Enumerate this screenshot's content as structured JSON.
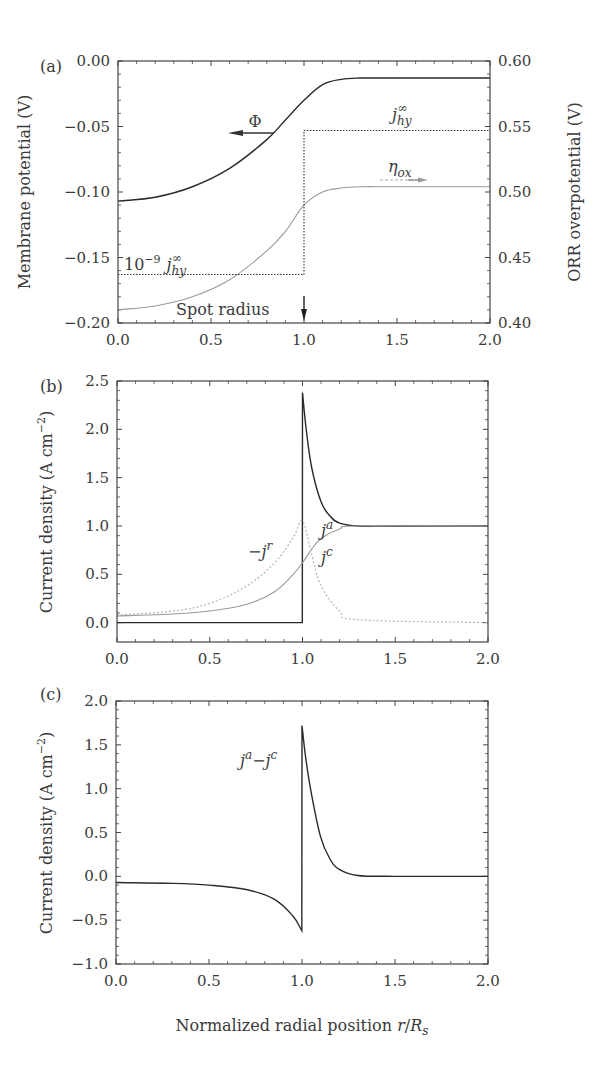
{
  "figure": {
    "xlabel": "Normalized radial position r/R_s",
    "xlabel_parts": {
      "main": "Normalized radial position ",
      "var": "r",
      "slash": "/",
      "R": "R",
      "sub": "s"
    }
  },
  "chart_data": [
    {
      "panel": "(a)",
      "type": "line",
      "xlabel": "",
      "ylabel": "Membrane potential (V)",
      "ylabel_right": "ORR overpotential (V)",
      "xlim": [
        0.0,
        2.0
      ],
      "ylim": [
        -0.2,
        0.0
      ],
      "ylim_right": [
        0.4,
        0.6
      ],
      "x_ticks": [
        "0.0",
        "0.5",
        "1.0",
        "1.5",
        "2.0"
      ],
      "y_ticks": [
        "0.00",
        "−0.05",
        "−0.10",
        "−0.15",
        "−0.20"
      ],
      "y_ticks_right": [
        "0.60",
        "0.55",
        "0.50",
        "0.45",
        "0.40"
      ],
      "grid": false,
      "series": [
        {
          "name": "Φ",
          "axis": "left",
          "style": "solid-dark",
          "x": [
            0.0,
            0.2,
            0.4,
            0.6,
            0.8,
            0.9,
            1.0,
            1.1,
            1.2,
            1.3,
            1.5,
            2.0
          ],
          "y": [
            -0.107,
            -0.104,
            -0.096,
            -0.082,
            -0.06,
            -0.045,
            -0.03,
            -0.018,
            -0.014,
            -0.013,
            -0.013,
            -0.013
          ]
        },
        {
          "name": "η_ox",
          "axis": "right",
          "style": "solid-light",
          "x": [
            0.0,
            0.2,
            0.4,
            0.6,
            0.8,
            0.9,
            1.0,
            1.1,
            1.2,
            1.3,
            1.5,
            2.0
          ],
          "y": [
            0.41,
            0.413,
            0.42,
            0.433,
            0.455,
            0.47,
            0.49,
            0.5,
            0.503,
            0.504,
            0.504,
            0.504
          ]
        },
        {
          "name": "j_hy",
          "axis": "left",
          "style": "dotted",
          "x": [
            0.0,
            1.0,
            1.0,
            2.0
          ],
          "y": [
            -0.163,
            -0.163,
            -0.053,
            -0.053
          ]
        }
      ],
      "annotations": [
        {
          "text": "Φ",
          "arrow": "left"
        },
        {
          "text": "η_ox",
          "arrow": "right"
        },
        {
          "text": "j_hy^∞"
        },
        {
          "text": "10^−9 j_hy^∞"
        },
        {
          "text": "Spot radius",
          "arrow": "down",
          "x": 1.0
        }
      ]
    },
    {
      "panel": "(b)",
      "type": "line",
      "xlabel": "",
      "ylabel": "Current density (A cm^−2)",
      "xlim": [
        0.0,
        2.0
      ],
      "ylim": [
        -0.2,
        2.5
      ],
      "x_ticks": [
        "0.0",
        "0.5",
        "1.0",
        "1.5",
        "2.0"
      ],
      "y_ticks": [
        "2.5",
        "2.0",
        "1.5",
        "1.0",
        "0.5",
        "0.0"
      ],
      "grid": false,
      "series": [
        {
          "name": "j^a",
          "style": "solid-dark",
          "x": [
            0.0,
            0.999,
            1.0,
            1.02,
            1.05,
            1.1,
            1.15,
            1.2,
            1.3,
            1.5,
            2.0
          ],
          "y": [
            0.0,
            0.0,
            2.38,
            2.0,
            1.6,
            1.25,
            1.1,
            1.03,
            1.0,
            1.0,
            1.0
          ]
        },
        {
          "name": "j^c",
          "style": "solid-light",
          "x": [
            0.0,
            0.3,
            0.5,
            0.7,
            0.85,
            0.95,
            1.0,
            1.05,
            1.1,
            1.2,
            1.3,
            2.0
          ],
          "y": [
            0.07,
            0.09,
            0.12,
            0.19,
            0.32,
            0.5,
            0.62,
            0.76,
            0.87,
            0.97,
            1.0,
            1.0
          ]
        },
        {
          "name": "−j^r",
          "style": "dotted-light",
          "x": [
            0.0,
            0.3,
            0.5,
            0.7,
            0.85,
            0.95,
            1.0,
            1.05,
            1.1,
            1.2,
            1.3,
            2.0
          ],
          "y": [
            0.08,
            0.12,
            0.2,
            0.38,
            0.62,
            0.88,
            1.05,
            0.7,
            0.38,
            0.12,
            0.03,
            0.0
          ]
        }
      ],
      "annotations": [
        {
          "text": "j^a"
        },
        {
          "text": "j^c"
        },
        {
          "text": "−j^r"
        }
      ]
    },
    {
      "panel": "(c)",
      "type": "line",
      "xlabel": "Normalized radial position r/R_s",
      "ylabel": "Current density (A cm^−2)",
      "xlim": [
        0.0,
        2.0
      ],
      "ylim": [
        -1.0,
        2.0
      ],
      "x_ticks": [
        "0.0",
        "0.5",
        "1.0",
        "1.5",
        "2.0"
      ],
      "y_ticks": [
        "2.0",
        "1.5",
        "1.0",
        "0.5",
        "0.0",
        "−0.5",
        "−1.0"
      ],
      "grid": false,
      "series": [
        {
          "name": "j^a − j^c",
          "style": "solid-dark",
          "x": [
            0.0,
            0.3,
            0.5,
            0.7,
            0.85,
            0.95,
            0.999,
            1.0,
            1.02,
            1.05,
            1.1,
            1.15,
            1.2,
            1.3,
            1.5,
            2.0
          ],
          "y": [
            -0.07,
            -0.08,
            -0.1,
            -0.15,
            -0.26,
            -0.45,
            -0.62,
            1.72,
            1.35,
            0.95,
            0.45,
            0.2,
            0.08,
            0.01,
            0.0,
            0.0
          ]
        }
      ],
      "annotations": [
        {
          "text": "j^a−j^c"
        }
      ]
    }
  ],
  "labels": {
    "a": {
      "panel": "(a)",
      "ylabel": "Membrane potential (V)",
      "ylabel_right": "ORR overpotential (V)",
      "phi": "Φ",
      "eta": "η",
      "eta_sub": "ox",
      "j": "j",
      "j_sub": "hy",
      "j_sup": "∞",
      "ten": "10",
      "ten_sup": "−9",
      "spot": "Spot radius"
    },
    "b": {
      "panel": "(b)",
      "ylabel_main": "Current density (A  cm",
      "ylabel_sup": "−2",
      "ylabel_end": ")",
      "ja": "j",
      "ja_sup": "a",
      "jc": "j",
      "jc_sup": "c",
      "jr_minus": "−j",
      "jr_sup": "r"
    },
    "c": {
      "panel": "(c)",
      "ylabel_main": "Current density (A  cm",
      "ylabel_sup": "−2",
      "ylabel_end": ")",
      "diff_j1": "j",
      "diff_sup1": "a",
      "diff_minus": "−j",
      "diff_sup2": "c"
    }
  }
}
